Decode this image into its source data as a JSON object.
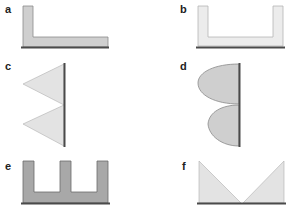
{
  "panels": [
    {
      "id": "a",
      "label": "a",
      "shape": "L-shape",
      "fill": "#cfcfcf"
    },
    {
      "id": "b",
      "label": "b",
      "shape": "U-shape",
      "fill": "#ececec"
    },
    {
      "id": "c",
      "label": "c",
      "shape": "two triangles on vertical line",
      "fill": "#e3e3e3"
    },
    {
      "id": "d",
      "label": "d",
      "shape": "two half-ellipses on vertical line",
      "fill": "#cfcfcf"
    },
    {
      "id": "e",
      "label": "e",
      "shape": "E-comb shape",
      "fill": "#a8a8a8"
    },
    {
      "id": "f",
      "label": "f",
      "shape": "two right triangles forming V",
      "fill": "#e3e3e3"
    }
  ],
  "colors": {
    "edge": "#555555",
    "baseline": "#4a4a4a",
    "outline": "#9a9a9a"
  }
}
